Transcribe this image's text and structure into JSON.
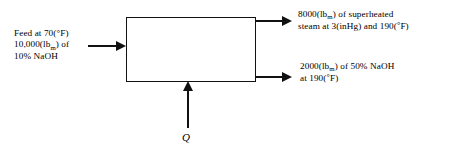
{
  "diagram": {
    "type": "process-block-flow",
    "unit": {
      "name": "evaporator-unit",
      "shape": "rectangle",
      "label": ""
    },
    "streams": {
      "feed": {
        "name": "feed-stream",
        "direction": "into-unit-from-left",
        "line1": "Feed at 70(°F)",
        "line2_prefix": "10,000(lb",
        "line2_sub": "m",
        "line2_suffix": ") of",
        "line3": "10% NaOH",
        "temperature": "70",
        "temperature_unit": "°F",
        "mass": "10,000",
        "mass_unit": "lb_m",
        "composition": "10% NaOH"
      },
      "vapor": {
        "name": "superheated-steam-stream",
        "direction": "out-of-unit-top-right",
        "line1_prefix": "8000(lb",
        "line1_sub": "m",
        "line1_suffix": ") of superheated",
        "line2_prefix": "steam at 3(inHg) and 190(",
        "line2_deg": "°",
        "line2_suffix": "F)",
        "mass": "8000",
        "mass_unit": "lb_m",
        "pressure": "3",
        "pressure_unit": "inHg",
        "temperature": "190",
        "temperature_unit": "°F",
        "description": "superheated steam"
      },
      "product": {
        "name": "concentrated-naoh-stream",
        "direction": "out-of-unit-bottom-right",
        "line1_prefix": "2000(lb",
        "line1_sub": "m",
        "line1_suffix": ") of 50% NaOH",
        "line2_prefix": "at 190(",
        "line2_deg": "°",
        "line2_suffix": "F)",
        "mass": "2000",
        "mass_unit": "lb_m",
        "composition": "50% NaOH",
        "temperature": "190",
        "temperature_unit": "°F"
      },
      "heat": {
        "name": "heat-input-stream",
        "direction": "into-unit-from-bottom",
        "label": "Q"
      }
    },
    "colors": {
      "background": "#ffffff",
      "line": "#111111",
      "text": "#000000"
    }
  }
}
